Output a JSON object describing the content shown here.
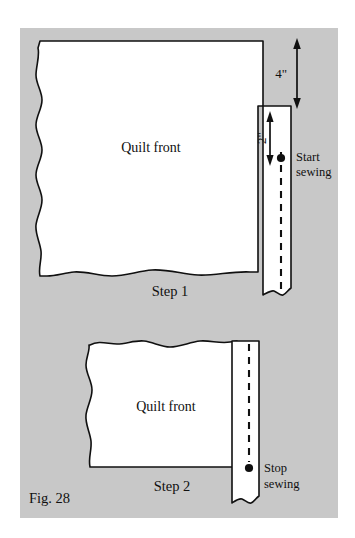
{
  "figure": {
    "caption": "Fig. 28",
    "background_color": "#c8c8c8",
    "panel_color": "#c8c8c8",
    "fabric_color": "#ffffff",
    "ink_color": "#101010",
    "page_color": "#ffffff"
  },
  "steps": [
    {
      "id": "step-1",
      "label": "Step 1",
      "quilt_label": "Quilt front",
      "measurements": [
        {
          "id": "four-inch",
          "value": "4\"",
          "orientation": "horizontal"
        },
        {
          "id": "two-inch",
          "value": "2\"",
          "orientation": "vertical"
        }
      ],
      "marker": {
        "id": "start-sewing",
        "line1": "Start",
        "line2": "sewing"
      }
    },
    {
      "id": "step-2",
      "label": "Step 2",
      "quilt_label": "Quilt front",
      "measurements": [],
      "marker": {
        "id": "stop-sewing",
        "line1": "Stop",
        "line2": "sewing"
      }
    }
  ]
}
